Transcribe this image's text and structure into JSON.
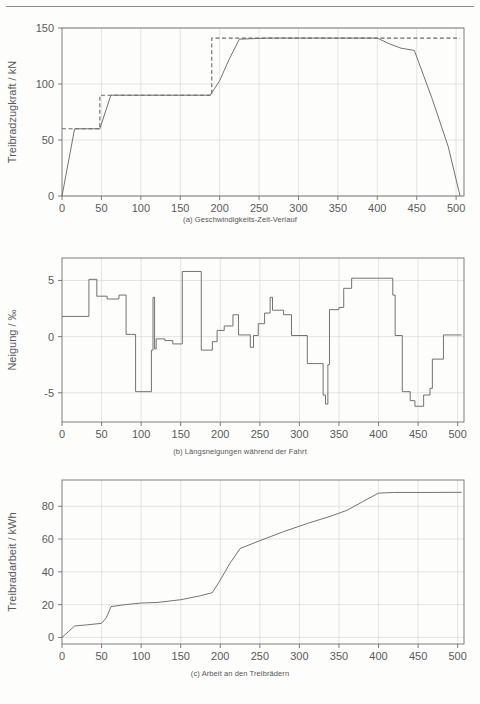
{
  "figure": {
    "top_rule": true,
    "panels": [
      "a",
      "b",
      "c"
    ]
  },
  "colors": {
    "line": "#6b6b6b",
    "axis": "#6f6f6f",
    "grid": "#d8d8d8",
    "text": "#5a5a5a",
    "background": "#fdfdfc"
  },
  "captions": {
    "a": "(a) Geschwindigkeits-Zeit-Verlauf",
    "b": "(b) Längsneigungen während der Fahrt",
    "c": "(c) Arbeit an den Treibrädern"
  },
  "chart_data": [
    {
      "id": "a",
      "type": "line",
      "title": "",
      "xlabel": "Geschwindigkeit / km/h",
      "ylabel": "Treibradzugkraft / kN",
      "xlim": [
        0,
        510
      ],
      "ylim": [
        0,
        150
      ],
      "xticks": [
        0,
        50,
        100,
        150,
        200,
        250,
        300,
        350,
        400,
        450,
        500
      ],
      "yticks": [
        0,
        50,
        100,
        150
      ],
      "grid": true,
      "legend": "none",
      "series": [
        {
          "name": "Zugkraftkennlinie (ausgefuehrt)",
          "style": "solid",
          "points": [
            [
              0,
              0
            ],
            [
              16,
              60
            ],
            [
              48,
              60
            ],
            [
              62,
              90
            ],
            [
              188,
              90
            ],
            [
              200,
              103
            ],
            [
              212,
              122
            ],
            [
              225,
              140
            ],
            [
              260,
              141
            ],
            [
              350,
              141
            ],
            [
              400,
              141
            ],
            [
              415,
              136
            ],
            [
              430,
              132
            ],
            [
              447,
              130
            ],
            [
              470,
              86
            ],
            [
              490,
              44
            ],
            [
              505,
              0
            ]
          ]
        },
        {
          "name": "Zugkraftgrenze (Stufen)",
          "style": "dashed",
          "points": [
            [
              0,
              60
            ],
            [
              48,
              60
            ],
            [
              48,
              90
            ],
            [
              190,
              90
            ],
            [
              190,
              141
            ],
            [
              400,
              141
            ],
            [
              505,
              141
            ]
          ]
        }
      ]
    },
    {
      "id": "b",
      "type": "line",
      "title": "",
      "xlabel": "Zeit / s",
      "ylabel": "Neigung / ‰",
      "xlim": [
        0,
        508
      ],
      "ylim": [
        -7.6,
        7.0
      ],
      "xticks": [
        0,
        50,
        100,
        150,
        200,
        250,
        300,
        350,
        400,
        450,
        500
      ],
      "yticks": [
        -5,
        0,
        5
      ],
      "grid": true,
      "legend": "none",
      "series": [
        {
          "name": "Längsneigung",
          "style": "solid",
          "step": true,
          "points": [
            [
              0,
              1.8
            ],
            [
              34,
              1.8
            ],
            [
              34,
              5.1
            ],
            [
              44,
              5.1
            ],
            [
              44,
              3.6
            ],
            [
              57,
              3.6
            ],
            [
              57,
              3.35
            ],
            [
              72,
              3.35
            ],
            [
              72,
              3.7
            ],
            [
              81,
              3.7
            ],
            [
              81,
              0.2
            ],
            [
              93,
              0.2
            ],
            [
              93,
              -4.9
            ],
            [
              113,
              -4.9
            ],
            [
              113,
              -1.2
            ],
            [
              115,
              -1.2
            ],
            [
              115,
              3.5
            ],
            [
              117,
              3.5
            ],
            [
              117,
              -1.1
            ],
            [
              119,
              -1.1
            ],
            [
              119,
              -0.2
            ],
            [
              130,
              -0.2
            ],
            [
              130,
              -0.35
            ],
            [
              140,
              -0.35
            ],
            [
              140,
              -0.65
            ],
            [
              152,
              -0.65
            ],
            [
              152,
              5.8
            ],
            [
              176,
              5.8
            ],
            [
              176,
              -1.2
            ],
            [
              190,
              -1.2
            ],
            [
              190,
              -0.45
            ],
            [
              196,
              -0.45
            ],
            [
              196,
              0.55
            ],
            [
              205,
              0.55
            ],
            [
              205,
              0.95
            ],
            [
              216,
              0.95
            ],
            [
              216,
              1.95
            ],
            [
              223,
              1.95
            ],
            [
              223,
              0.15
            ],
            [
              238,
              0.15
            ],
            [
              238,
              -0.95
            ],
            [
              242,
              -0.95
            ],
            [
              242,
              0.1
            ],
            [
              248,
              0.1
            ],
            [
              248,
              1.15
            ],
            [
              256,
              1.15
            ],
            [
              256,
              2.1
            ],
            [
              263,
              2.1
            ],
            [
              263,
              3.5
            ],
            [
              266,
              3.5
            ],
            [
              266,
              2.35
            ],
            [
              280,
              2.35
            ],
            [
              280,
              1.95
            ],
            [
              290,
              1.95
            ],
            [
              290,
              0.1
            ],
            [
              310,
              0.1
            ],
            [
              310,
              -2.4
            ],
            [
              330,
              -2.4
            ],
            [
              330,
              -5.2
            ],
            [
              333,
              -5.2
            ],
            [
              333,
              -6.0
            ],
            [
              336,
              -6.0
            ],
            [
              336,
              -2.5
            ],
            [
              338,
              -2.5
            ],
            [
              338,
              2.4
            ],
            [
              350,
              2.4
            ],
            [
              350,
              2.6
            ],
            [
              356,
              2.6
            ],
            [
              356,
              4.3
            ],
            [
              366,
              4.3
            ],
            [
              366,
              5.2
            ],
            [
              418,
              5.2
            ],
            [
              418,
              3.7
            ],
            [
              421,
              3.7
            ],
            [
              421,
              0.1
            ],
            [
              430,
              0.1
            ],
            [
              430,
              -4.9
            ],
            [
              440,
              -4.9
            ],
            [
              440,
              -5.7
            ],
            [
              446,
              -5.7
            ],
            [
              446,
              -6.2
            ],
            [
              457,
              -6.2
            ],
            [
              457,
              -5.2
            ],
            [
              465,
              -5.2
            ],
            [
              465,
              -4.6
            ],
            [
              468,
              -4.6
            ],
            [
              468,
              -2.0
            ],
            [
              482,
              -2.0
            ],
            [
              482,
              0.15
            ],
            [
              505,
              0.15
            ]
          ]
        }
      ]
    },
    {
      "id": "c",
      "type": "line",
      "title": "",
      "xlabel": "Zeit / s",
      "ylabel": "Treibradarbeit / kWh",
      "xlim": [
        0,
        508
      ],
      "ylim": [
        -4,
        96
      ],
      "xticks": [
        0,
        50,
        100,
        150,
        200,
        250,
        300,
        350,
        400,
        450,
        500
      ],
      "yticks": [
        0,
        20,
        40,
        60,
        80
      ],
      "grid": true,
      "legend": "none",
      "series": [
        {
          "name": "Treibradarbeit",
          "style": "solid",
          "points": [
            [
              0,
              0
            ],
            [
              8,
              3.5
            ],
            [
              16,
              7.0
            ],
            [
              30,
              7.6
            ],
            [
              50,
              8.6
            ],
            [
              56,
              12.0
            ],
            [
              62,
              18.8
            ],
            [
              80,
              20.0
            ],
            [
              100,
              21.0
            ],
            [
              120,
              21.3
            ],
            [
              150,
              23.0
            ],
            [
              175,
              25.4
            ],
            [
              190,
              27.3
            ],
            [
              200,
              35.0
            ],
            [
              212,
              45.0
            ],
            [
              225,
              54.2
            ],
            [
              250,
              59.0
            ],
            [
              280,
              64.5
            ],
            [
              310,
              69.5
            ],
            [
              340,
              74.0
            ],
            [
              360,
              77.5
            ],
            [
              380,
              82.8
            ],
            [
              400,
              88.0
            ],
            [
              420,
              88.4
            ],
            [
              460,
              88.4
            ],
            [
              505,
              88.5
            ]
          ]
        }
      ]
    }
  ]
}
